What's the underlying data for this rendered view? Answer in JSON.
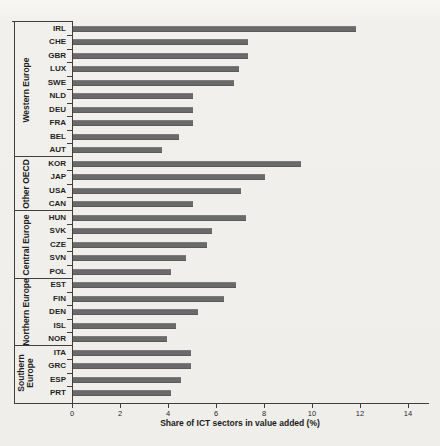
{
  "chart_data": {
    "type": "bar",
    "orientation": "horizontal",
    "xlabel": "Share of ICT sectors in value added (%)",
    "xlim": [
      0,
      14
    ],
    "xticks": [
      0,
      2,
      4,
      6,
      8,
      10,
      12,
      14
    ],
    "grid": false,
    "legend": false,
    "bar_color": "#6a6a6a",
    "axis_color": "#3f3f3f",
    "text_color": "#1f1f1f",
    "background_color": "#f1f0ed",
    "groups": [
      {
        "name": "Western Europe",
        "categories": [
          "IRL",
          "CHE",
          "GBR",
          "LUX",
          "SWE",
          "NLD",
          "DEU",
          "FRA",
          "BEL",
          "AUT"
        ],
        "values": [
          11.8,
          7.3,
          7.3,
          6.9,
          6.7,
          5.0,
          5.0,
          5.0,
          4.4,
          3.7
        ]
      },
      {
        "name": "Other OECD",
        "categories": [
          "KOR",
          "JAP",
          "USA",
          "CAN"
        ],
        "values": [
          9.5,
          8.0,
          7.0,
          5.0
        ]
      },
      {
        "name": "Central Europe",
        "categories": [
          "HUN",
          "SVK",
          "CZE",
          "SVN",
          "POL"
        ],
        "values": [
          7.2,
          5.8,
          5.6,
          4.7,
          4.1
        ]
      },
      {
        "name": "Northern Europe",
        "categories": [
          "EST",
          "FIN",
          "DEN",
          "ISL",
          "NOR"
        ],
        "values": [
          6.8,
          6.3,
          5.2,
          4.3,
          3.9
        ]
      },
      {
        "name": "Southern Europe",
        "categories": [
          "ITA",
          "GRC",
          "ESP",
          "PRT"
        ],
        "values": [
          4.9,
          4.9,
          4.5,
          4.1
        ]
      }
    ]
  }
}
